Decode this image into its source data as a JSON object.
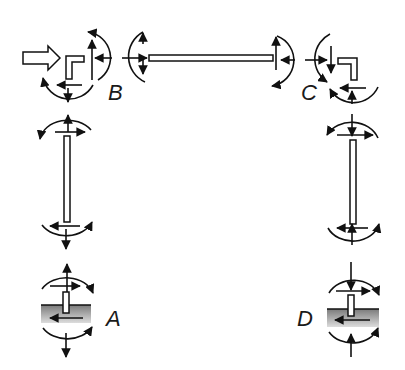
{
  "diagram": {
    "title": "",
    "type": "free-body diagram of portal frame joints and members",
    "labels": {
      "A": "A",
      "B": "B",
      "C": "C",
      "D": "D"
    },
    "nodes": [
      {
        "id": "A",
        "label": "A",
        "role": "fixed support (bottom left)"
      },
      {
        "id": "B",
        "label": "B",
        "role": "top left joint"
      },
      {
        "id": "C",
        "label": "C",
        "role": "top right joint"
      },
      {
        "id": "D",
        "label": "D",
        "role": "fixed support (bottom right)"
      }
    ],
    "members": [
      {
        "id": "beam-BC",
        "from": "B",
        "to": "C",
        "orientation": "horizontal"
      },
      {
        "id": "column-AB",
        "from": "A",
        "to": "B",
        "orientation": "vertical"
      },
      {
        "id": "column-DC",
        "from": "D",
        "to": "C",
        "orientation": "vertical"
      }
    ],
    "applied_load": {
      "at": "B",
      "direction": "right",
      "shape": "hollow block arrow"
    },
    "colors": {
      "line": "#111111",
      "ground_top": "#7a7a7a",
      "ground_bottom": "#d8d8d8",
      "background": "#ffffff"
    }
  }
}
